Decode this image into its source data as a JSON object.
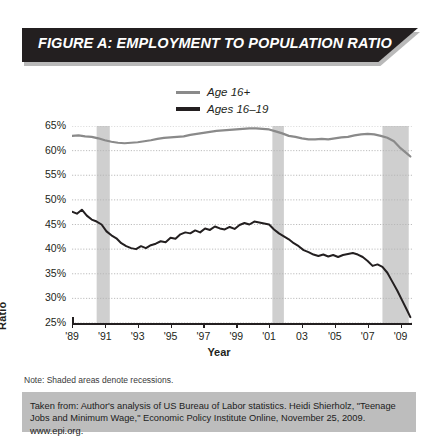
{
  "banner": {
    "title": "FIGURE A: EMPLOYMENT TO POPULATION RATIO"
  },
  "footer": {
    "note": "Note: Shaded areas denote recessions.",
    "source": "Taken from: Author's analysis of US Bureau of Labor statistics. Heidi Shierholz, \"Teenage Jobs and Minimum Wage,\" Economic Policy Institute Online, November 25, 2009. www.epi.org."
  },
  "colors": {
    "banner_bg": "#231f20",
    "banner_text": "#ffffff",
    "line_total": "#8a8a8a",
    "line_teen": "#231f20",
    "recession_band": "#cfcfcf",
    "gridline": "#b5b5b5",
    "source_band": "#bdbdbd"
  },
  "chart_data": {
    "type": "line",
    "title": "FIGURE A: EMPLOYMENT TO POPULATION RATIO",
    "xlabel": "Year",
    "ylabel": "Ratio",
    "xlim": [
      1989,
      2009.7
    ],
    "ylim": [
      25,
      65
    ],
    "ytick_values": [
      65,
      60,
      55,
      50,
      45,
      40,
      35,
      30,
      25
    ],
    "ytick_labels": [
      "65%",
      "60%",
      "55%",
      "50%",
      "45%",
      "40%",
      "35%",
      "30%",
      "25%"
    ],
    "xtick_values": [
      1989,
      1991,
      1993,
      1995,
      1997,
      1999,
      2001,
      2003,
      2005,
      2007,
      2009
    ],
    "xtick_labels": [
      "'89",
      "'91",
      "'93",
      "'95",
      "'97",
      "'99",
      "'01",
      "03",
      "'05",
      "'07",
      "'09"
    ],
    "grid": "horizontal-dotted",
    "legend_position": "above-plot-center",
    "annotations": [
      "Shaded areas denote recessions."
    ],
    "recessions": [
      {
        "start": 1990.5,
        "end": 1991.3
      },
      {
        "start": 2001.2,
        "end": 2001.9
      },
      {
        "start": 2007.9,
        "end": 2009.5
      }
    ],
    "series": [
      {
        "name": "Age 16+",
        "color": "#8a8a8a",
        "width": 2.2,
        "x": [
          1989.0,
          1989.4,
          1989.8,
          1990.2,
          1990.6,
          1991.0,
          1991.4,
          1991.8,
          1992.2,
          1992.6,
          1993.0,
          1993.4,
          1993.8,
          1994.2,
          1994.6,
          1995.0,
          1995.4,
          1995.8,
          1996.2,
          1996.6,
          1997.0,
          1997.4,
          1997.8,
          1998.2,
          1998.6,
          1999.0,
          1999.4,
          1999.8,
          2000.2,
          2000.6,
          2001.0,
          2001.4,
          2001.8,
          2002.2,
          2002.6,
          2003.0,
          2003.4,
          2003.8,
          2004.2,
          2004.6,
          2005.0,
          2005.4,
          2005.8,
          2006.2,
          2006.6,
          2007.0,
          2007.4,
          2007.8,
          2008.2,
          2008.6,
          2009.0,
          2009.4,
          2009.6
        ],
        "y": [
          63.0,
          63.1,
          62.9,
          62.8,
          62.5,
          62.1,
          61.8,
          61.6,
          61.5,
          61.6,
          61.7,
          61.9,
          62.1,
          62.4,
          62.6,
          62.7,
          62.8,
          62.9,
          63.2,
          63.4,
          63.6,
          63.8,
          64.0,
          64.1,
          64.2,
          64.3,
          64.4,
          64.5,
          64.5,
          64.4,
          64.3,
          63.9,
          63.5,
          63.0,
          62.8,
          62.5,
          62.3,
          62.3,
          62.4,
          62.3,
          62.5,
          62.7,
          62.8,
          63.1,
          63.3,
          63.4,
          63.3,
          63.0,
          62.6,
          61.9,
          60.5,
          59.4,
          58.8
        ]
      },
      {
        "name": "Ages 16-19",
        "color": "#231f20",
        "width": 2.0,
        "x": [
          1989.0,
          1989.3,
          1989.6,
          1989.9,
          1990.2,
          1990.5,
          1990.8,
          1991.1,
          1991.4,
          1991.7,
          1992.0,
          1992.3,
          1992.6,
          1992.9,
          1993.2,
          1993.5,
          1993.8,
          1994.1,
          1994.4,
          1994.7,
          1995.0,
          1995.3,
          1995.6,
          1995.9,
          1996.2,
          1996.5,
          1996.8,
          1997.1,
          1997.4,
          1997.7,
          1998.0,
          1998.3,
          1998.6,
          1998.9,
          1999.2,
          1999.5,
          1999.8,
          2000.1,
          2000.4,
          2000.7,
          2001.0,
          2001.3,
          2001.6,
          2001.9,
          2002.2,
          2002.5,
          2002.8,
          2003.1,
          2003.4,
          2003.7,
          2004.0,
          2004.3,
          2004.6,
          2004.9,
          2005.2,
          2005.5,
          2005.8,
          2006.1,
          2006.4,
          2006.7,
          2007.0,
          2007.3,
          2007.6,
          2007.9,
          2008.2,
          2008.5,
          2008.8,
          2009.1,
          2009.4,
          2009.6
        ],
        "y": [
          47.6,
          47.2,
          48.0,
          46.8,
          46.0,
          45.6,
          45.0,
          43.6,
          42.8,
          42.2,
          41.2,
          40.6,
          40.2,
          40.0,
          40.6,
          40.2,
          40.8,
          41.1,
          41.6,
          41.4,
          42.3,
          42.1,
          43.0,
          43.4,
          43.2,
          43.8,
          43.4,
          44.2,
          43.9,
          44.6,
          44.2,
          44.0,
          44.5,
          44.1,
          44.9,
          45.3,
          45.0,
          45.6,
          45.4,
          45.2,
          45.0,
          44.0,
          43.2,
          42.6,
          42.0,
          41.2,
          40.6,
          39.8,
          39.4,
          38.9,
          38.6,
          38.9,
          38.5,
          38.8,
          38.4,
          38.8,
          39.0,
          39.2,
          38.9,
          38.4,
          37.6,
          36.6,
          36.9,
          36.4,
          35.2,
          33.4,
          31.6,
          29.6,
          27.6,
          26.2
        ]
      }
    ]
  }
}
